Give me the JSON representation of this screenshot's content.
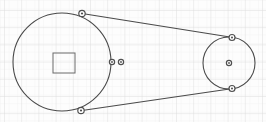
{
  "figure": {
    "width": 266,
    "height": 122,
    "background_color": "#fdfdfd",
    "ink_color": "#4a4a4a",
    "marker_color": "#555555"
  },
  "grid": {
    "description": "faint graph-paper grid",
    "minor_spacing": 8.6,
    "major_spacing": 17.2,
    "minor_color": "#f0f0f0",
    "major_color": "#dcdcdc",
    "visible": true,
    "major_x_lines": [
      4,
      21,
      38,
      56,
      73,
      90,
      108,
      125,
      142,
      160,
      177,
      194,
      211,
      229,
      246,
      263
    ],
    "major_y_lines": [
      10,
      27,
      45,
      62,
      79,
      96,
      113
    ]
  },
  "chart_data": {
    "type": "diagram",
    "axis_ranges": {
      "x": [
        0,
        266
      ],
      "y": [
        0,
        122
      ]
    },
    "pulleys": [
      {
        "name": "large-pulley",
        "cx": 62,
        "cy": 62,
        "r": 49,
        "stroke": "#4a4a4a",
        "stroke_width": 1.1
      },
      {
        "name": "small-pulley",
        "cx": 229,
        "cy": 63,
        "r": 26,
        "stroke": "#4a4a4a",
        "stroke_width": 1.1
      }
    ],
    "hub": {
      "name": "square-hub",
      "x": 53,
      "y": 53,
      "width": 22,
      "height": 20,
      "stroke": "#6a6a6a",
      "stroke_width": 1.0
    },
    "belt_lines": [
      {
        "name": "upper-belt-span",
        "x1": 82,
        "y1": 13.5,
        "x2": 233,
        "y2": 37.5
      },
      {
        "name": "lower-belt-span",
        "x1": 82,
        "y1": 110.5,
        "x2": 233,
        "y2": 88.5
      }
    ],
    "markers": [
      {
        "name": "tangent-marker-large-top",
        "cx": 82,
        "cy": 13.5,
        "r": 3.2,
        "filled": false
      },
      {
        "name": "tangent-marker-large-bottom",
        "cx": 81,
        "cy": 110.5,
        "r": 3.2,
        "filled": false
      },
      {
        "name": "tangent-marker-small-top",
        "cx": 232,
        "cy": 37.5,
        "r": 3.0,
        "filled": false
      },
      {
        "name": "tangent-marker-small-bottom",
        "cx": 232,
        "cy": 88.5,
        "r": 3.0,
        "filled": false
      },
      {
        "name": "center-marker-small-pulley",
        "cx": 229,
        "cy": 63,
        "r": 2.6,
        "filled": false
      },
      {
        "name": "rim-marker-inner",
        "cx": 112,
        "cy": 62,
        "r": 2.6,
        "filled": false
      },
      {
        "name": "rim-marker-outer",
        "cx": 121,
        "cy": 62,
        "r": 2.6,
        "filled": false
      }
    ]
  }
}
